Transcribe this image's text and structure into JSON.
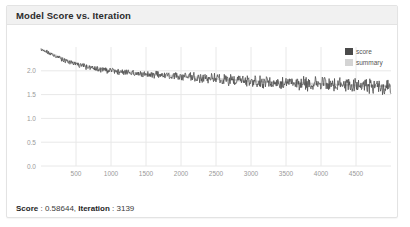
{
  "card": {
    "title": "Model Score vs. Iteration"
  },
  "legend": {
    "position": "top-right",
    "items": [
      {
        "label": "score",
        "color": "#4a4a4a"
      },
      {
        "label": "summary",
        "color": "#d4d4d4"
      }
    ]
  },
  "footer": {
    "score_label": "Score",
    "score_sep": " : ",
    "score_value": "0.58644",
    "comma": ", ",
    "iteration_label": "Iteration",
    "iteration_sep": " : ",
    "iteration_value": "3139"
  },
  "colors": {
    "card_bg": "#ffffff",
    "card_border": "#e3e3e3",
    "header_bg": "#f1f1f1",
    "title_text": "#2c2c2c",
    "grid": "#e8e8e8",
    "axis_text": "#9a9a9a",
    "series_score": "#4a4a4a",
    "series_summary": "#d4d4d4"
  },
  "chart_data": {
    "type": "line",
    "title": "Model Score vs. Iteration",
    "xlabel": "",
    "ylabel": "",
    "grid": true,
    "legend_position": "top-right",
    "xlim": [
      0,
      5000
    ],
    "ylim": [
      0,
      2.5
    ],
    "xticks": [
      500,
      1000,
      1500,
      2000,
      2500,
      3000,
      3500,
      4000,
      4500
    ],
    "yticks": [
      0.0,
      0.5,
      1.0,
      1.5,
      2.0
    ],
    "xtick_labels": [
      "500",
      "1000",
      "1500",
      "2000",
      "2500",
      "3000",
      "3500",
      "4000",
      "4500"
    ],
    "ytick_labels": [
      "0.0",
      "0.5",
      "1.0",
      "1.5",
      "2.0"
    ],
    "series": [
      {
        "name": "score",
        "color": "#4a4a4a",
        "description": "Noisy per-iteration model score decaying from ~2.45 at iteration 0 to ~1.68 at iteration 5000, with high-frequency oscillation amplitude growing from ~0.05 early to ~0.15 late.",
        "x": [
          0,
          100,
          200,
          300,
          400,
          500,
          600,
          700,
          800,
          900,
          1000,
          1100,
          1200,
          1300,
          1400,
          1500,
          1600,
          1700,
          1800,
          1900,
          2000,
          2100,
          2200,
          2300,
          2400,
          2500,
          2600,
          2700,
          2800,
          2900,
          3000,
          3100,
          3200,
          3300,
          3400,
          3500,
          3600,
          3700,
          3800,
          3900,
          4000,
          4100,
          4200,
          4300,
          4400,
          4500,
          4600,
          4700,
          4800,
          4900,
          5000
        ],
        "y": [
          2.45,
          2.38,
          2.3,
          2.24,
          2.19,
          2.14,
          2.1,
          2.07,
          2.04,
          2.02,
          2.0,
          1.98,
          1.97,
          1.96,
          1.94,
          1.93,
          1.92,
          1.91,
          1.9,
          1.89,
          1.88,
          1.87,
          1.86,
          1.85,
          1.84,
          1.83,
          1.82,
          1.81,
          1.8,
          1.79,
          1.78,
          1.77,
          1.77,
          1.76,
          1.75,
          1.75,
          1.74,
          1.73,
          1.73,
          1.72,
          1.72,
          1.71,
          1.71,
          1.7,
          1.7,
          1.69,
          1.69,
          1.69,
          1.68,
          1.68,
          1.68
        ]
      },
      {
        "name": "summary",
        "color": "#d4d4d4",
        "description": "Smoothed summary band underlying the score trace (largely obscured by the score series).",
        "x": [
          0,
          500,
          1000,
          1500,
          2000,
          2500,
          3000,
          3500,
          4000,
          4500,
          5000
        ],
        "y": [
          2.45,
          2.14,
          2.0,
          1.93,
          1.88,
          1.83,
          1.78,
          1.75,
          1.72,
          1.69,
          1.68
        ]
      }
    ],
    "highlight_point": {
      "iteration": 3139,
      "score": 0.58644
    }
  }
}
